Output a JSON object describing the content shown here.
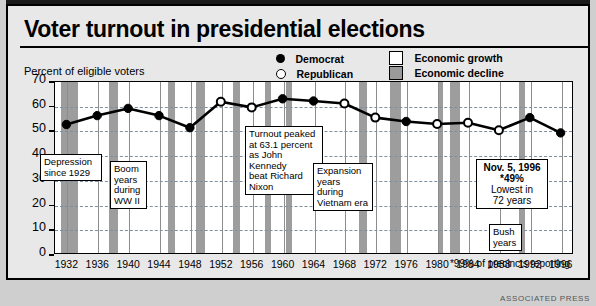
{
  "title": "Voter turnout in presidential elections",
  "axis": {
    "ylabel": "Percent of eligible voters",
    "yticks": [
      "70",
      "60",
      "50",
      "40",
      "30",
      "20",
      "10",
      "0"
    ],
    "xticks": [
      "1932",
      "1936",
      "1940",
      "1944",
      "1948",
      "1952",
      "1956",
      "1960",
      "1964",
      "1968",
      "1972",
      "1976",
      "1980",
      "1984",
      "1988",
      "1992",
      "1996"
    ]
  },
  "legend": {
    "democrat": "Democrat",
    "republican": "Republican",
    "growth": "Economic growth",
    "decline": "Economic decline"
  },
  "callouts": {
    "depression": "Depression\nsince 1929",
    "boom": "Boom\nyears\nduring\nWW II",
    "peak": "Turnout peaked\nat 63.1 percent\nas John Kennedy\nbeat Richard\nNixon",
    "expansion": "Expansion\nyears\nduring\nVietnam era",
    "bush": "Bush\nyears",
    "nineteen96_line1": "Nov. 5, 1996",
    "nineteen96_line2": "*49%",
    "nineteen96_line3": "Lowest in",
    "nineteen96_line4": "72 years"
  },
  "footnote": "*99% of precincts reporting",
  "credit": "ASSOCIATED PRESS",
  "colors": {
    "decline_band": "#9d9d9d",
    "growth_band": "#ffffff",
    "line": "#000000",
    "page_bg": "#e8e8e8"
  },
  "chart_data": {
    "type": "line",
    "title": "Voter turnout in presidential elections",
    "xlabel": "",
    "ylabel": "Percent of eligible voters",
    "ylim": [
      0,
      70
    ],
    "grid": true,
    "legend_position": "top-right",
    "x": [
      1932,
      1936,
      1940,
      1944,
      1948,
      1952,
      1956,
      1960,
      1964,
      1968,
      1972,
      1976,
      1980,
      1984,
      1988,
      1992,
      1996
    ],
    "values": [
      52.4,
      56.0,
      58.9,
      56.0,
      51.1,
      61.6,
      59.3,
      62.8,
      61.9,
      60.9,
      55.2,
      53.6,
      52.6,
      53.1,
      50.1,
      55.2,
      49.0
    ],
    "point_party": [
      "Democrat",
      "Democrat",
      "Democrat",
      "Democrat",
      "Democrat",
      "Republican",
      "Republican",
      "Democrat",
      "Democrat",
      "Republican",
      "Republican",
      "Democrat",
      "Republican",
      "Republican",
      "Republican",
      "Democrat",
      "Democrat"
    ],
    "economy_bands": [
      {
        "label": "Economic decline",
        "start": 1931.2,
        "end": 1933.4
      },
      {
        "label": "Economic decline",
        "start": 1937.4,
        "end": 1938.6
      },
      {
        "label": "Economic decline",
        "start": 1945.0,
        "end": 1946.0
      },
      {
        "label": "Economic decline",
        "start": 1948.6,
        "end": 1949.8
      },
      {
        "label": "Economic decline",
        "start": 1953.4,
        "end": 1954.4
      },
      {
        "label": "Economic decline",
        "start": 1957.6,
        "end": 1958.4
      },
      {
        "label": "Economic decline",
        "start": 1960.3,
        "end": 1961.1
      },
      {
        "label": "Economic decline",
        "start": 1969.8,
        "end": 1970.8
      },
      {
        "label": "Economic decline",
        "start": 1973.8,
        "end": 1975.2
      },
      {
        "label": "Economic decline",
        "start": 1980.0,
        "end": 1980.6
      },
      {
        "label": "Economic decline",
        "start": 1981.5,
        "end": 1982.8
      },
      {
        "label": "Economic decline",
        "start": 1990.5,
        "end": 1991.3
      }
    ]
  }
}
